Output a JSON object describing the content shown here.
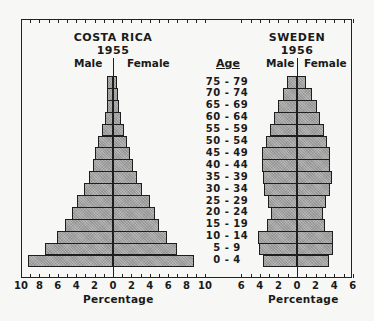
{
  "chart_data": {
    "type": "bar",
    "subtype": "population-pyramid",
    "age_header": "Age",
    "categories": [
      "75-79",
      "70-74",
      "65-69",
      "60-64",
      "55-59",
      "50-54",
      "45-49",
      "40-44",
      "35-39",
      "30-34",
      "25-29",
      "20-24",
      "15-19",
      "10-14",
      "5-9",
      "0-4"
    ],
    "xlabel": "Percentage",
    "grid": false,
    "panels": [
      {
        "title": "COSTA RICA",
        "year": "1955",
        "left_label": "Male",
        "right_label": "Female",
        "xlim": [
          -10,
          10
        ],
        "xticks": [
          "10",
          "8",
          "6",
          "4",
          "2",
          "0",
          "2",
          "4",
          "6",
          "8",
          "10"
        ],
        "series": [
          {
            "name": "Male",
            "values": [
              0.6,
              0.6,
              0.7,
              0.9,
              1.2,
              1.6,
              2.0,
              2.2,
              2.6,
              3.2,
              3.9,
              4.5,
              5.2,
              6.1,
              7.4,
              9.2
            ]
          },
          {
            "name": "Female",
            "values": [
              0.4,
              0.5,
              0.7,
              0.9,
              1.2,
              1.5,
              1.9,
              2.2,
              2.6,
              3.1,
              4.0,
              4.6,
              5.0,
              5.9,
              7.0,
              8.8
            ]
          }
        ]
      },
      {
        "title": "SWEDEN",
        "year": "1956",
        "left_label": "Male",
        "right_label": "Female",
        "xlim": [
          -6,
          6
        ],
        "xticks": [
          "6",
          "4",
          "2",
          "0",
          "2",
          "4",
          "6"
        ],
        "series": [
          {
            "name": "Male",
            "values": [
              1.1,
              1.5,
              2.0,
              2.5,
              2.9,
              3.3,
              3.8,
              3.8,
              3.7,
              3.6,
              3.1,
              2.8,
              3.2,
              4.2,
              4.1,
              3.7
            ]
          },
          {
            "name": "Female",
            "values": [
              1.0,
              1.6,
              2.1,
              2.5,
              2.9,
              3.2,
              3.6,
              3.6,
              3.8,
              3.5,
              3.1,
              2.8,
              3.0,
              3.9,
              3.9,
              3.4
            ]
          }
        ]
      }
    ]
  },
  "colors": {
    "bar_fill": "#a9a9a9",
    "outline": "#1e1e1e",
    "background": "#f7f7f5"
  }
}
